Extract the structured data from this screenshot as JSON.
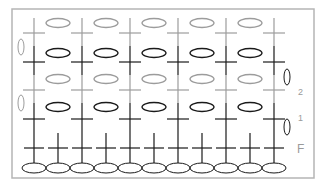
{
  "diagram": {
    "type": "crochet-stitch-chart",
    "frame": {
      "x": 12,
      "y": 9,
      "w": 302,
      "h": 169,
      "color": "#b5b5b5"
    },
    "colors": {
      "dark": "#1a1a1a",
      "gray": "#9c9c9c"
    },
    "chain_row": {
      "count": 11,
      "y": 168,
      "start_x": 34,
      "spacing": 24,
      "rx": 12,
      "ry": 5
    },
    "foundation_row": {
      "label": "F",
      "count": 11,
      "start_x": 34,
      "spacing": 24,
      "bar_y": 148,
      "top_y": 133
    },
    "rows": [
      {
        "index": 1,
        "label": "1",
        "shade": "dark",
        "bar_y": 119,
        "top_y": 103,
        "bottom_y": 133,
        "oval_y": 107,
        "turn": "right",
        "turn_y": 127
      },
      {
        "index": 2,
        "label": "2",
        "shade": "gray",
        "bar_y": 90,
        "top_y": 75,
        "bottom_y": 103,
        "oval_y": 79,
        "turn": "left",
        "turn_y": 103
      },
      {
        "index": 3,
        "label": "",
        "shade": "dark",
        "bar_y": 62,
        "top_y": 46,
        "bottom_y": 75,
        "oval_y": 53,
        "turn": "right",
        "turn_y": 77
      },
      {
        "index": 4,
        "label": "",
        "shade": "gray",
        "bar_y": 33,
        "top_y": 18,
        "bottom_y": 46,
        "oval_y": 23,
        "turn": "left",
        "turn_y": 47
      }
    ],
    "cross_columns": [
      34,
      82,
      130,
      178,
      226,
      274
    ],
    "oval_columns": [
      58,
      106,
      154,
      202,
      250
    ],
    "row_labels": [
      {
        "text": "2",
        "x": 298,
        "y": 88
      },
      {
        "text": "1",
        "x": 298,
        "y": 114
      },
      {
        "text": "F",
        "x": 297,
        "y": 143
      }
    ]
  }
}
